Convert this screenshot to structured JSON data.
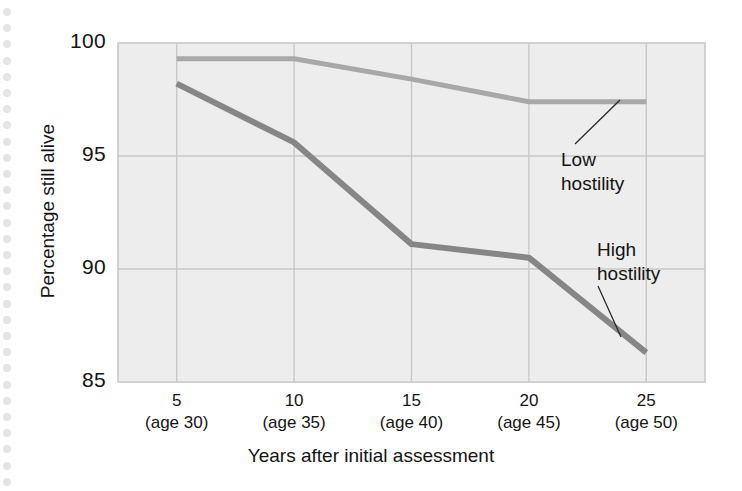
{
  "figure": {
    "background_color": "#ffffff",
    "plot_background_color": "#ededed",
    "grid_color": "#c8c8c8",
    "binding_hole_color": "#e3e4e6",
    "binding_hole_count": 30
  },
  "chart_data": {
    "type": "line",
    "title": "",
    "xlabel": "Years after initial assessment",
    "ylabel": "Percentage still alive",
    "x": [
      5,
      10,
      15,
      20,
      25
    ],
    "categories": [
      "5\n(age 30)",
      "10\n(age 35)",
      "15\n(age 40)",
      "20\n(age 45)",
      "25\n(age 50)"
    ],
    "xtick_labels": [
      {
        "years": "5",
        "age": "(age 30)"
      },
      {
        "years": "10",
        "age": "(age 35)"
      },
      {
        "years": "15",
        "age": "(age 40)"
      },
      {
        "years": "20",
        "age": "(age 45)"
      },
      {
        "years": "25",
        "age": "(age 50)"
      }
    ],
    "ytick_labels": [
      "100",
      "95",
      "90",
      "85"
    ],
    "yticks": [
      100,
      95,
      90,
      85
    ],
    "ylim": [
      85,
      100
    ],
    "xlim": [
      2.5,
      27.5
    ],
    "grid": true,
    "legend_position": "inline-annotations",
    "series": [
      {
        "name": "Low hostility",
        "color": "#a8a8a8",
        "line_width": 5,
        "values": [
          99.3,
          99.3,
          98.4,
          97.4,
          97.4
        ]
      },
      {
        "name": "High hostility",
        "color": "#868686",
        "line_width": 6,
        "values": [
          98.2,
          95.6,
          91.1,
          90.5,
          86.3
        ]
      }
    ],
    "annotations": [
      {
        "text_line1": "Low",
        "text_line2": "hostility",
        "points_to_series": "Low hostility",
        "points_to_x": 25
      },
      {
        "text_line1": "High",
        "text_line2": "hostility",
        "points_to_series": "High hostility",
        "points_to_x": 25
      }
    ]
  }
}
